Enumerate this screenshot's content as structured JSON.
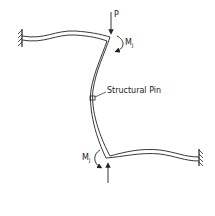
{
  "diagram": {
    "labels": {
      "load": "P",
      "moment_top": "M",
      "moment_top_sub": "J",
      "moment_bottom": "M",
      "moment_bottom_sub": "J",
      "pin": "Structural Pin"
    },
    "colors": {
      "line": "#222222",
      "background": "#ffffff"
    },
    "elements": [
      {
        "type": "fixed-support",
        "position": "left"
      },
      {
        "type": "beam",
        "name": "top-beam"
      },
      {
        "type": "column",
        "name": "deflected-column"
      },
      {
        "type": "beam",
        "name": "bottom-beam"
      },
      {
        "type": "fixed-support",
        "position": "right"
      },
      {
        "type": "point-load",
        "name": "P",
        "direction": "down"
      },
      {
        "type": "reaction",
        "direction": "up"
      },
      {
        "type": "moment",
        "name": "MJ",
        "position": "top-joint"
      },
      {
        "type": "moment",
        "name": "MJ",
        "position": "bottom-joint"
      },
      {
        "type": "pin",
        "name": "structural-pin"
      }
    ]
  }
}
